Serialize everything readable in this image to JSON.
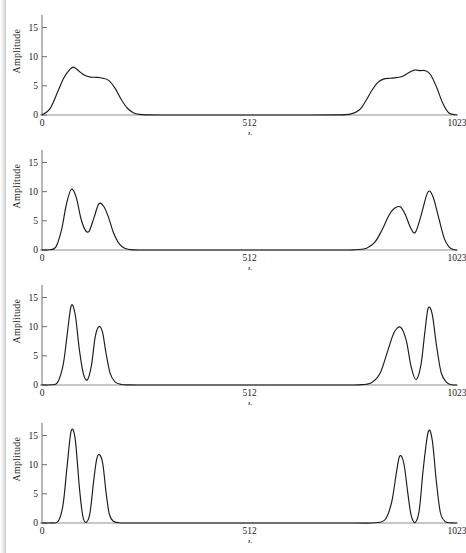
{
  "figure": {
    "panel_count": 4,
    "shared": {
      "ylabel": "Amplitude",
      "xlabel": "k",
      "y_ticks": [
        "0",
        "5",
        "10",
        "15"
      ],
      "y_tick_values": [
        0,
        5,
        10,
        15
      ],
      "x_ticks": [
        "0",
        "512",
        "1023"
      ],
      "x_tick_values": [
        0,
        512,
        1023
      ],
      "curve_color": "#1b1b1b",
      "axis_color": "#8f8f8f",
      "background": "#ffffff"
    }
  },
  "chart_data": [
    {
      "type": "line",
      "title": "",
      "xlabel": "k",
      "ylabel": "Amplitude",
      "xlim": [
        0,
        1023
      ],
      "ylim": [
        0,
        16.8
      ],
      "xticks": [
        0,
        512,
        1023
      ],
      "xticklabels": [
        "0",
        "512",
        "1023"
      ],
      "yticks": [
        0,
        5,
        10,
        15
      ],
      "yticklabels": [
        "0",
        "5",
        "10",
        "15"
      ],
      "grid": false,
      "legend": null,
      "series": [
        {
          "name": "spectrum-1",
          "peaks": [
            {
              "center": 78,
              "height": 8.2,
              "width": 46
            },
            {
              "center": 150,
              "height": 6.4,
              "width": 46
            },
            {
              "center": 873,
              "height": 6.4,
              "width": 46
            },
            {
              "center": 945,
              "height": 8.2,
              "width": 46
            }
          ],
          "x": [
            0,
            20,
            40,
            55,
            70,
            78,
            90,
            105,
            120,
            135,
            150,
            165,
            180,
            195,
            210,
            225,
            240,
            260,
            300,
            400,
            512,
            620,
            720,
            760,
            783,
            798,
            813,
            828,
            843,
            858,
            873,
            888,
            903,
            918,
            933,
            945,
            958,
            973,
            988,
            1003,
            1023
          ],
          "y": [
            0,
            1.1,
            4.2,
            6.5,
            7.9,
            8.2,
            7.6,
            6.8,
            6.5,
            6.45,
            6.3,
            5.9,
            4.6,
            2.7,
            1.2,
            0.4,
            0.1,
            0.02,
            0,
            0,
            0,
            0,
            0.02,
            0.15,
            0.9,
            2.4,
            4.2,
            5.6,
            6.2,
            6.3,
            6.4,
            6.6,
            7.2,
            7.7,
            7.6,
            7.6,
            6.9,
            4.7,
            2.0,
            0.35,
            0
          ]
        }
      ]
    },
    {
      "type": "line",
      "title": "",
      "xlabel": "k",
      "ylabel": "Amplitude",
      "xlim": [
        0,
        1023
      ],
      "ylim": [
        0,
        16.8
      ],
      "xticks": [
        0,
        512,
        1023
      ],
      "xticklabels": [
        "0",
        "512",
        "1023"
      ],
      "yticks": [
        0,
        5,
        10,
        15
      ],
      "yticklabels": [
        "0",
        "5",
        "10",
        "15"
      ],
      "grid": false,
      "legend": null,
      "series": [
        {
          "name": "spectrum-2",
          "peaks": [
            {
              "center": 72,
              "height": 10.4,
              "width": 34
            },
            {
              "center": 140,
              "height": 7.9,
              "width": 32
            },
            {
              "center": 883,
              "height": 7.4,
              "width": 32
            },
            {
              "center": 951,
              "height": 9.9,
              "width": 34
            }
          ],
          "valley": 3.2,
          "x": [
            0,
            18,
            34,
            48,
            60,
            72,
            84,
            96,
            106,
            116,
            128,
            140,
            152,
            164,
            176,
            190,
            205,
            225,
            260,
            330,
            512,
            700,
            770,
            800,
            820,
            838,
            855,
            868,
            883,
            896,
            908,
            920,
            934,
            951,
            964,
            978,
            992,
            1004,
            1014,
            1023
          ],
          "y": [
            0,
            0.05,
            0.5,
            3.4,
            7.8,
            10.4,
            9.1,
            5.4,
            3.5,
            3.2,
            5.5,
            7.9,
            7.5,
            5.6,
            3.0,
            1.1,
            0.25,
            0.02,
            0,
            0,
            0,
            0,
            0.03,
            0.3,
            1.3,
            3.4,
            5.9,
            7.1,
            7.4,
            6.0,
            3.9,
            3.0,
            5.8,
            9.9,
            9.1,
            5.5,
            1.9,
            0.5,
            0.08,
            0
          ]
        }
      ]
    },
    {
      "type": "line",
      "title": "",
      "xlabel": "k",
      "ylabel": "Amplitude",
      "xlim": [
        0,
        1023
      ],
      "ylim": [
        0,
        16.8
      ],
      "xticks": [
        0,
        512,
        1023
      ],
      "xticklabels": [
        "0",
        "512",
        "1023"
      ],
      "yticks": [
        0,
        5,
        10,
        15
      ],
      "yticklabels": [
        "0",
        "5",
        "10",
        "15"
      ],
      "grid": false,
      "legend": null,
      "series": [
        {
          "name": "spectrum-3",
          "peaks": [
            {
              "center": 72,
              "height": 13.6,
              "width": 26
            },
            {
              "center": 140,
              "height": 10.0,
              "width": 24
            },
            {
              "center": 884,
              "height": 9.9,
              "width": 24
            },
            {
              "center": 952,
              "height": 13.2,
              "width": 26
            }
          ],
          "valley": 0.85,
          "x": [
            0,
            20,
            38,
            52,
            62,
            72,
            82,
            92,
            102,
            112,
            122,
            131,
            140,
            149,
            158,
            168,
            180,
            196,
            215,
            250,
            330,
            512,
            700,
            780,
            812,
            834,
            852,
            868,
            884,
            898,
            910,
            922,
            934,
            944,
            952,
            962,
            972,
            984,
            998,
            1010,
            1023
          ],
          "y": [
            0,
            0.04,
            0.4,
            3.4,
            8.6,
            13.6,
            12.0,
            6.1,
            1.9,
            0.9,
            3.4,
            8.2,
            10.0,
            9.1,
            5.4,
            2.0,
            0.55,
            0.08,
            0.01,
            0,
            0,
            0,
            0,
            0.03,
            0.4,
            2.1,
            5.8,
            9.0,
            9.9,
            7.6,
            3.1,
            0.9,
            3.4,
            9.2,
            13.2,
            12.1,
            7.0,
            2.1,
            0.4,
            0.05,
            0
          ]
        }
      ]
    },
    {
      "type": "line",
      "title": "",
      "xlabel": "k",
      "ylabel": "Amplitude",
      "xlim": [
        0,
        1023
      ],
      "ylim": [
        0,
        16.8
      ],
      "xticks": [
        0,
        512,
        1023
      ],
      "xticklabels": [
        "0",
        "512",
        "1023"
      ],
      "yticks": [
        0,
        5,
        10,
        15
      ],
      "yticklabels": [
        "0",
        "5",
        "10",
        "15"
      ],
      "grid": false,
      "legend": null,
      "series": [
        {
          "name": "spectrum-4",
          "peaks": [
            {
              "center": 72,
              "height": 15.8,
              "width": 22
            },
            {
              "center": 142,
              "height": 11.7,
              "width": 20
            },
            {
              "center": 882,
              "height": 11.5,
              "width": 20
            },
            {
              "center": 952,
              "height": 15.6,
              "width": 22
            }
          ],
          "valley": 0.1,
          "x": [
            0,
            22,
            40,
            52,
            62,
            72,
            82,
            92,
            100,
            108,
            118,
            128,
            135,
            142,
            150,
            158,
            166,
            176,
            190,
            210,
            260,
            512,
            760,
            820,
            846,
            862,
            874,
            882,
            892,
            902,
            910,
            920,
            930,
            940,
            952,
            962,
            972,
            982,
            994,
            1008,
            1023
          ],
          "y": [
            0,
            0.03,
            0.3,
            3.2,
            9.8,
            15.8,
            14.3,
            6.2,
            1.4,
            0.1,
            1.6,
            7.6,
            11.0,
            11.7,
            10.1,
            5.2,
            1.5,
            0.3,
            0.04,
            0,
            0,
            0,
            0,
            0.04,
            0.6,
            3.6,
            8.8,
            11.5,
            10.2,
            5.0,
            1.3,
            0.1,
            2.2,
            9.4,
            15.6,
            14.2,
            7.2,
            1.8,
            0.25,
            0.03,
            0
          ]
        }
      ]
    }
  ]
}
